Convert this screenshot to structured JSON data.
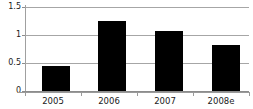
{
  "chart_data": {
    "type": "bar",
    "title": "",
    "subtitle": "",
    "xlabel": "",
    "ylabel": "",
    "categories": [
      "2005",
      "2006",
      "2007",
      "2008e"
    ],
    "values": [
      0.45,
      1.25,
      1.07,
      0.83
    ],
    "ylim": [
      0,
      1.5
    ],
    "yticks": [
      "0",
      "0.5",
      "1",
      "1.5"
    ],
    "ytick_values": [
      0,
      0.5,
      1,
      1.5
    ],
    "grid": true,
    "legend": false,
    "legend_position": "none",
    "series": [
      {
        "name": "",
        "values": [
          0.45,
          1.25,
          1.07,
          0.83
        ],
        "color": "#000000"
      }
    ],
    "colors": {
      "bar": "#000000",
      "grid": "#a6a6a6",
      "axis": "#9a9a9a",
      "text": "#1a1a1a",
      "background": "#ffffff"
    }
  }
}
